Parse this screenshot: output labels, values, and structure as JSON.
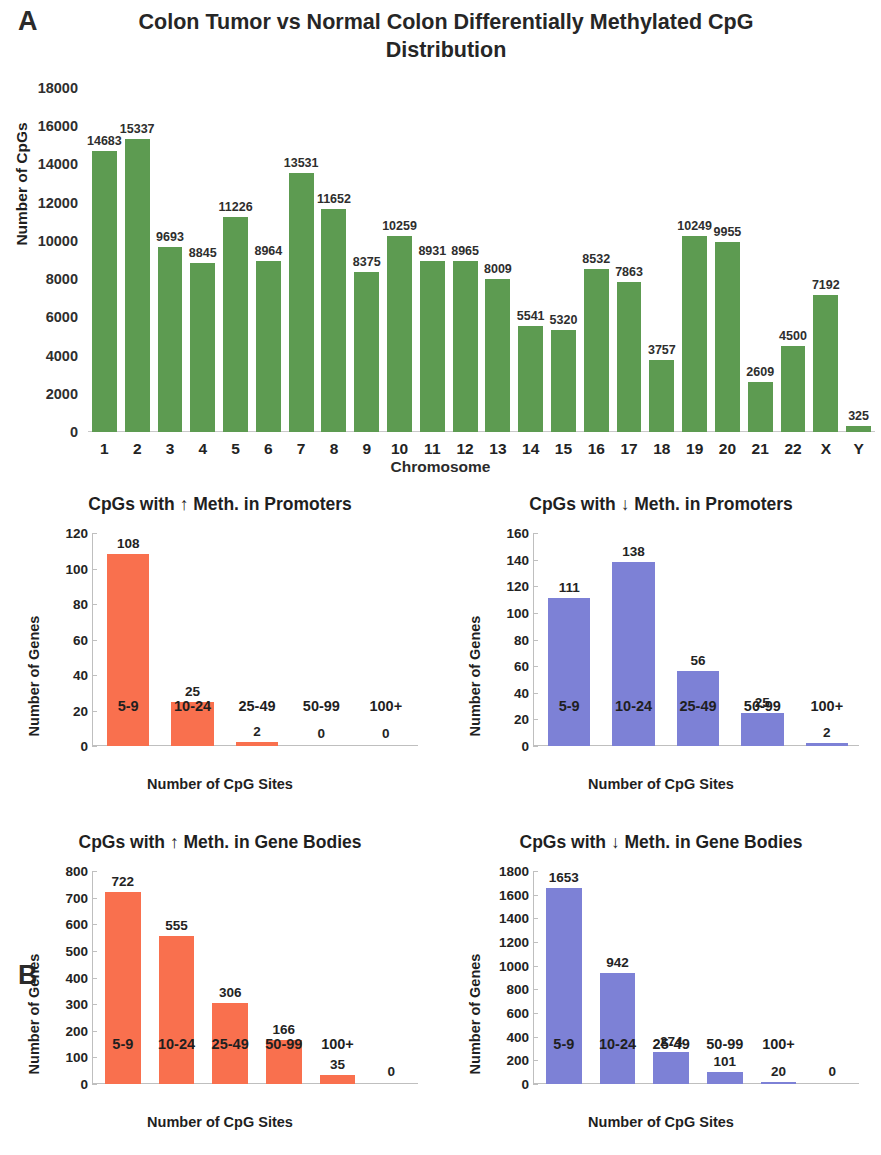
{
  "panels": {
    "a_letter": "A",
    "b_letter": "B"
  },
  "colors": {
    "green": "#5d9b51",
    "orange": "#f9704e",
    "purple": "#7d81d6",
    "axis": "#bfbfbf",
    "text": "#232323"
  },
  "chart_data": [
    {
      "type": "bar",
      "id": "chromosome-distribution",
      "title": "Colon Tumor vs Normal Colon Differentially Methylated CpG Distribution",
      "xlabel": "Chromosome",
      "ylabel": "Number of CpGs",
      "ylim": [
        0,
        18000
      ],
      "ytick_step": 2000,
      "yticks": [
        "18000",
        "16000",
        "14000",
        "12000",
        "10000",
        "8000",
        "6000",
        "4000",
        "2000",
        "0"
      ],
      "grid": false,
      "legend": "none",
      "color": "#5d9b51",
      "categories": [
        "1",
        "2",
        "3",
        "4",
        "5",
        "6",
        "7",
        "8",
        "9",
        "10",
        "11",
        "12",
        "13",
        "14",
        "15",
        "16",
        "17",
        "18",
        "19",
        "20",
        "21",
        "22",
        "X",
        "Y"
      ],
      "values": [
        14683,
        15337,
        9693,
        8845,
        11226,
        8964,
        13531,
        11652,
        8375,
        10259,
        8931,
        8965,
        8009,
        5541,
        5320,
        8532,
        7863,
        3757,
        10249,
        9955,
        2609,
        4500,
        7192,
        325
      ],
      "labels": [
        "14683",
        "15337",
        "9693",
        "8845",
        "11226",
        "8964",
        "13531",
        "11652",
        "8375",
        "10259",
        "8931",
        "8965",
        "8009",
        "5541",
        "5320",
        "8532",
        "7863",
        "3757",
        "10249",
        "9955",
        "2609",
        "4500",
        "7192",
        "325"
      ]
    },
    {
      "type": "bar",
      "id": "hyper-meth-promoters",
      "title": "CpGs with ↑ Meth. in Promoters",
      "xlabel": "Number of CpG Sites",
      "ylabel": "Number of Genes",
      "ylim": [
        0,
        120
      ],
      "ytick_step": 20,
      "yticks": [
        "120",
        "100",
        "80",
        "60",
        "40",
        "20",
        "0"
      ],
      "grid": false,
      "legend": "none",
      "color": "#f9704e",
      "categories": [
        "5-9",
        "10-24",
        "25-49",
        "50-99",
        "100+"
      ],
      "values": [
        108,
        25,
        2,
        0,
        0
      ],
      "labels": [
        "108",
        "25",
        "2",
        "0",
        "0"
      ]
    },
    {
      "type": "bar",
      "id": "hypo-meth-promoters",
      "title": "CpGs with ↓ Meth. in Promoters",
      "xlabel": "Number of CpG Sites",
      "ylabel": "Number of Genes",
      "ylim": [
        0,
        160
      ],
      "ytick_step": 20,
      "yticks": [
        "160",
        "140",
        "120",
        "100",
        "80",
        "60",
        "40",
        "20",
        "0"
      ],
      "grid": false,
      "legend": "none",
      "color": "#7d81d6",
      "categories": [
        "5-9",
        "10-24",
        "25-49",
        "50-99",
        "100+"
      ],
      "values": [
        111,
        138,
        56,
        25,
        2
      ],
      "labels": [
        "111",
        "138",
        "56",
        "25",
        "2"
      ]
    },
    {
      "type": "bar",
      "id": "hyper-meth-gene-bodies",
      "title": "CpGs with ↑ Meth. in Gene Bodies",
      "xlabel": "Number of CpG Sites",
      "ylabel": "Number of Genes",
      "ylim": [
        0,
        800
      ],
      "ytick_step": 100,
      "yticks": [
        "800",
        "700",
        "600",
        "500",
        "400",
        "300",
        "200",
        "100",
        "0"
      ],
      "grid": false,
      "legend": "none",
      "color": "#f9704e",
      "categories": [
        "5-9",
        "10-24",
        "25-49",
        "50-99",
        "100+",
        ""
      ],
      "values": [
        722,
        555,
        306,
        166,
        35,
        0
      ],
      "labels": [
        "722",
        "555",
        "306",
        "166",
        "35",
        "0"
      ]
    },
    {
      "type": "bar",
      "id": "hypo-meth-gene-bodies",
      "title": "CpGs with ↓ Meth. in Gene Bodies",
      "xlabel": "Number of CpG Sites",
      "ylabel": "Number of Genes",
      "ylim": [
        0,
        1800
      ],
      "ytick_step": 200,
      "yticks": [
        "1800",
        "1600",
        "1400",
        "1200",
        "1000",
        "800",
        "600",
        "400",
        "200",
        "0"
      ],
      "grid": false,
      "legend": "none",
      "color": "#7d81d6",
      "categories": [
        "5-9",
        "10-24",
        "25-49",
        "50-99",
        "100+",
        ""
      ],
      "values": [
        1653,
        942,
        274,
        101,
        20,
        0
      ],
      "labels": [
        "1653",
        "942",
        "274",
        "101",
        "20",
        "0"
      ]
    }
  ]
}
